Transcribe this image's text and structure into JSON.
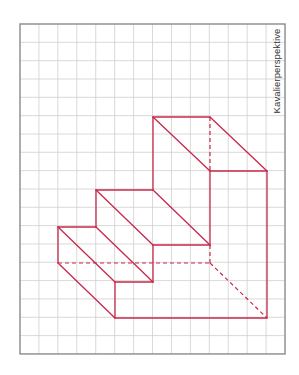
{
  "figure": {
    "label": "Kavalierperspektive",
    "colors": {
      "grid_line": "#cfcfcf",
      "grid_border": "#8a8a8a",
      "drawing": "#c8284a",
      "drawing_dark": "#7a2a4a",
      "background": "#ffffff"
    },
    "grid": {
      "x0": 20,
      "y0": 24,
      "cols": 14,
      "rows": 18,
      "cell_w": 18.93,
      "cell_h": 18.33
    },
    "solid_lines": [
      [
        153,
        117,
        210,
        117
      ],
      [
        153,
        117,
        153,
        190
      ],
      [
        153,
        117,
        210,
        171
      ],
      [
        210,
        117,
        267,
        171
      ],
      [
        210,
        171,
        267,
        171
      ],
      [
        267,
        171,
        267,
        318
      ],
      [
        96,
        190,
        153,
        190
      ],
      [
        96,
        190,
        96,
        227
      ],
      [
        96,
        190,
        153,
        245
      ],
      [
        153,
        190,
        210,
        245
      ],
      [
        153,
        245,
        210,
        245
      ],
      [
        210,
        171,
        210,
        245
      ],
      [
        58,
        227,
        96,
        227
      ],
      [
        58,
        227,
        58,
        263
      ],
      [
        58,
        227,
        115,
        282
      ],
      [
        96,
        227,
        153,
        282
      ],
      [
        115,
        282,
        153,
        282
      ],
      [
        153,
        245,
        153,
        282
      ],
      [
        58,
        263,
        115,
        318
      ],
      [
        115,
        282,
        115,
        318
      ],
      [
        115,
        318,
        267,
        318
      ]
    ],
    "dashed_lines": [
      [
        210,
        117,
        210,
        171
      ],
      [
        58,
        263,
        210,
        263
      ],
      [
        210,
        245,
        210,
        263
      ],
      [
        210,
        263,
        267,
        318
      ]
    ]
  }
}
